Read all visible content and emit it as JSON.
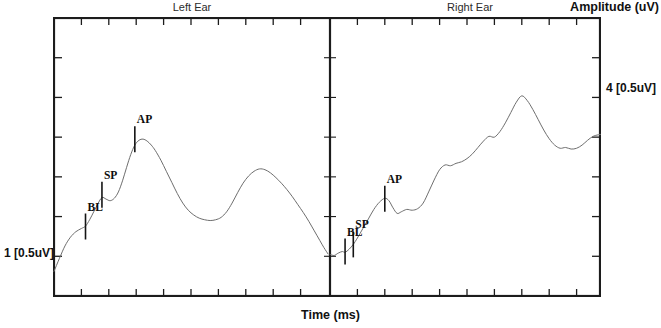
{
  "figure": {
    "left_panel_title": "Left Ear",
    "right_panel_title": "Right Ear",
    "y_axis_title": "Amplitude (uV)",
    "x_axis_title": "Time (ms)",
    "left_scale_label": "1 [0.5uV]",
    "right_scale_label": "4 [0.5uV]"
  },
  "markers": {
    "bl": "BL",
    "sp": "SP",
    "ap": "AP"
  },
  "chart_data": {
    "type": "line",
    "xlabel": "Time (ms)",
    "ylabel": "Amplitude (uV)",
    "grid": false,
    "legend": "none",
    "panels": [
      {
        "name": "Left Ear",
        "title": "Left Ear",
        "scale_label": "1 [0.5uV]",
        "xlim": [
          0,
          10
        ],
        "ylim": [
          0,
          7
        ],
        "x_ticks": [
          0,
          1,
          2,
          3,
          4,
          5,
          6,
          7,
          8,
          9,
          10
        ],
        "y_ticks": [
          0,
          1,
          2,
          3,
          4,
          5,
          6,
          7
        ],
        "x_tick_labels": [],
        "y_tick_labels": [],
        "annotations": [
          {
            "label": "BL",
            "x": 1.15,
            "y": 1.75,
            "type": "baseline-marker"
          },
          {
            "label": "SP",
            "x": 1.75,
            "y": 2.55,
            "type": "summating-potential-marker"
          },
          {
            "label": "AP",
            "x": 2.95,
            "y": 3.95,
            "type": "action-potential-marker"
          }
        ],
        "series": [
          {
            "name": "Left Ear ECochG waveform",
            "x": [
              0.0,
              0.2,
              0.4,
              0.6,
              0.8,
              1.0,
              1.15,
              1.3,
              1.45,
              1.6,
              1.75,
              1.9,
              2.05,
              2.2,
              2.35,
              2.5,
              2.65,
              2.8,
              2.95,
              3.1,
              3.25,
              3.4,
              3.55,
              3.7,
              3.9,
              4.1,
              4.3,
              4.5,
              4.7,
              4.9,
              5.1,
              5.3,
              5.5,
              5.7,
              5.9,
              6.1,
              6.3,
              6.5,
              6.7,
              6.9,
              7.1,
              7.3,
              7.5,
              7.7,
              7.9,
              8.1,
              8.3,
              8.5,
              8.7,
              8.9,
              9.1,
              9.3,
              9.5,
              9.7,
              9.85,
              10.0
            ],
            "y": [
              0.62,
              0.95,
              1.26,
              1.48,
              1.62,
              1.7,
              1.76,
              1.92,
              2.12,
              2.32,
              2.48,
              2.44,
              2.4,
              2.46,
              2.62,
              2.9,
              3.24,
              3.56,
              3.8,
              3.92,
              3.95,
              3.9,
              3.8,
              3.66,
              3.42,
              3.14,
              2.86,
              2.58,
              2.34,
              2.16,
              2.04,
              1.96,
              1.92,
              1.9,
              1.92,
              1.98,
              2.12,
              2.34,
              2.6,
              2.84,
              3.02,
              3.14,
              3.2,
              3.18,
              3.1,
              2.98,
              2.84,
              2.68,
              2.5,
              2.3,
              2.1,
              1.88,
              1.64,
              1.4,
              1.22,
              1.06
            ]
          }
        ]
      },
      {
        "name": "Right Ear",
        "title": "Right Ear",
        "scale_label": "4 [0.5uV]",
        "xlim": [
          0,
          10
        ],
        "ylim": [
          0,
          7
        ],
        "x_ticks": [
          0,
          1,
          2,
          3,
          4,
          5,
          6,
          7,
          8,
          9,
          10
        ],
        "y_ticks": [
          0,
          1,
          2,
          3,
          4,
          5,
          6,
          7
        ],
        "x_tick_labels": [],
        "y_tick_labels": [],
        "annotations": [
          {
            "label": "BL",
            "x": 0.55,
            "y": 1.12,
            "type": "baseline-marker"
          },
          {
            "label": "SP",
            "x": 0.85,
            "y": 1.3,
            "type": "summating-potential-marker"
          },
          {
            "label": "AP",
            "x": 2.0,
            "y": 2.45,
            "type": "action-potential-marker"
          }
        ],
        "series": [
          {
            "name": "Right Ear ECochG waveform",
            "x": [
              0.0,
              0.15,
              0.3,
              0.45,
              0.55,
              0.7,
              0.85,
              1.0,
              1.2,
              1.4,
              1.6,
              1.8,
              2.0,
              2.15,
              2.3,
              2.45,
              2.6,
              2.8,
              3.0,
              3.2,
              3.4,
              3.6,
              3.8,
              4.0,
              4.2,
              4.4,
              4.6,
              4.8,
              5.0,
              5.2,
              5.4,
              5.6,
              5.8,
              6.0,
              6.2,
              6.4,
              6.6,
              6.8,
              7.0,
              7.2,
              7.4,
              7.6,
              7.8,
              8.0,
              8.2,
              8.4,
              8.6,
              8.8,
              9.0,
              9.2,
              9.4,
              9.6,
              9.8,
              10.0
            ],
            "y": [
              1.05,
              1.02,
              1.08,
              1.12,
              1.1,
              1.18,
              1.3,
              1.46,
              1.7,
              1.94,
              2.18,
              2.36,
              2.46,
              2.4,
              2.22,
              2.08,
              2.12,
              2.18,
              2.16,
              2.2,
              2.34,
              2.62,
              2.92,
              3.18,
              3.3,
              3.28,
              3.34,
              3.38,
              3.46,
              3.58,
              3.74,
              3.9,
              4.02,
              4.0,
              4.14,
              4.36,
              4.62,
              4.88,
              5.04,
              4.92,
              4.7,
              4.44,
              4.18,
              3.96,
              3.8,
              3.72,
              3.74,
              3.7,
              3.72,
              3.8,
              3.92,
              4.02,
              4.06,
              4.08
            ]
          }
        ]
      }
    ]
  }
}
